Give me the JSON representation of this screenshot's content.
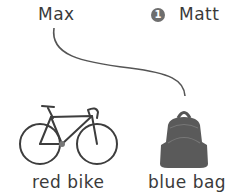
{
  "people": [
    {
      "name": "Max"
    },
    {
      "name": "Matt",
      "badge": "1"
    }
  ],
  "items": [
    {
      "caption": "red bike",
      "icon": "bicycle-icon"
    },
    {
      "caption": "blue bag",
      "icon": "backpack-icon"
    }
  ],
  "connections": [
    {
      "from": "Max",
      "to": "blue bag"
    }
  ],
  "colors": {
    "line": "#555555",
    "badge": "#6e6e6e",
    "text": "#3a3a3a"
  }
}
